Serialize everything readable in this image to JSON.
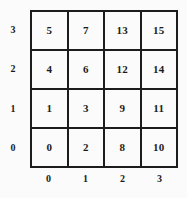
{
  "chart_data": {
    "type": "heatmap",
    "title": "",
    "xlabel": "",
    "ylabel": "",
    "grid": true,
    "legend": "none",
    "columns": 4,
    "rows": 4,
    "x_tick_labels": [
      "0",
      "1",
      "2",
      "3"
    ],
    "y_tick_labels_top_to_bottom": [
      "3",
      "2",
      "1",
      "0"
    ],
    "xlim": [
      0,
      3
    ],
    "ylim": [
      0,
      3
    ],
    "cell_order": "rows listed top-to-bottom (y=3 first), each row left-to-right (x=0 first)",
    "cells": [
      [
        "5",
        "7",
        "13",
        "15"
      ],
      [
        "4",
        "6",
        "12",
        "14"
      ],
      [
        "1",
        "3",
        "9",
        "11"
      ],
      [
        "0",
        "2",
        "8",
        "10"
      ]
    ],
    "values_by_coordinate": [
      {
        "x": 0,
        "y": 3,
        "value": 5
      },
      {
        "x": 1,
        "y": 3,
        "value": 7
      },
      {
        "x": 2,
        "y": 3,
        "value": 13
      },
      {
        "x": 3,
        "y": 3,
        "value": 15
      },
      {
        "x": 0,
        "y": 2,
        "value": 4
      },
      {
        "x": 1,
        "y": 2,
        "value": 6
      },
      {
        "x": 2,
        "y": 2,
        "value": 12
      },
      {
        "x": 3,
        "y": 2,
        "value": 14
      },
      {
        "x": 0,
        "y": 1,
        "value": 1
      },
      {
        "x": 1,
        "y": 1,
        "value": 3
      },
      {
        "x": 2,
        "y": 1,
        "value": 9
      },
      {
        "x": 3,
        "y": 1,
        "value": 11
      },
      {
        "x": 0,
        "y": 0,
        "value": 0
      },
      {
        "x": 1,
        "y": 0,
        "value": 2
      },
      {
        "x": 2,
        "y": 0,
        "value": 8
      },
      {
        "x": 3,
        "y": 0,
        "value": 10
      }
    ],
    "colors": {
      "line": "#1c1c1c",
      "text": "#1a1a1a",
      "background": "#fbfbfb"
    }
  }
}
